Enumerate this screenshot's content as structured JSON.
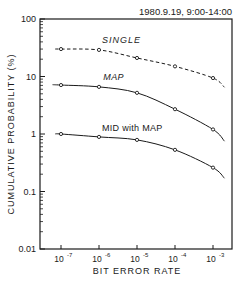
{
  "chart_data": {
    "type": "line",
    "title": "1980.9.19, 9:00-14:00",
    "xlabel": "BIT ERROR RATE",
    "ylabel": "CUMULATIVE PROBABILITY (%)",
    "xscale": "log",
    "yscale": "log",
    "xlim": [
      3e-08,
      0.002
    ],
    "ylim": [
      0.01,
      100
    ],
    "grid": false,
    "x_ticks": [
      {
        "value": 1e-07,
        "base": "10",
        "exp": "-7"
      },
      {
        "value": 1e-06,
        "base": "10",
        "exp": "-6"
      },
      {
        "value": 1e-05,
        "base": "10",
        "exp": "-5"
      },
      {
        "value": 0.0001,
        "base": "10",
        "exp": "-4"
      },
      {
        "value": 0.001,
        "base": "10",
        "exp": "-3"
      }
    ],
    "y_ticks": [
      {
        "value": 100,
        "label": "100"
      },
      {
        "value": 10,
        "label": "10"
      },
      {
        "value": 1,
        "label": "1"
      },
      {
        "value": 0.1,
        "label": "0.1"
      },
      {
        "value": 0.01,
        "label": "0.01"
      }
    ],
    "x": [
      1e-07,
      1e-06,
      1e-05,
      0.0001,
      0.001
    ],
    "series": [
      {
        "name": "SINGLE",
        "style": "dashed",
        "values": [
          30,
          29,
          21,
          15,
          9.4
        ],
        "curve_start": [
          7e-08,
          30
        ],
        "curve_end": [
          0.002,
          6.5
        ],
        "label_pos": [
          1.2e-06,
          38
        ]
      },
      {
        "name": "MAP",
        "style": "solid",
        "values": [
          7.1,
          6.6,
          5.2,
          2.7,
          1.2
        ],
        "curve_start": [
          6e-08,
          7.2
        ],
        "curve_end": [
          0.002,
          0.75
        ],
        "label_pos": [
          1.3e-06,
          8.6
        ]
      },
      {
        "name": "MID with MAP",
        "style": "solid",
        "values": [
          1.0,
          0.89,
          0.79,
          0.53,
          0.26
        ],
        "curve_start": [
          7e-08,
          1.0
        ],
        "curve_end": [
          0.002,
          0.17
        ],
        "label_pos": [
          1.2e-06,
          1.15
        ]
      }
    ],
    "legend": "inline labels next to curves"
  }
}
